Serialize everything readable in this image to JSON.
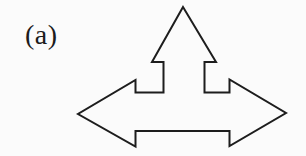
{
  "figure": {
    "label": "(a)",
    "background": "#fbfbfb",
    "ink_color": "#1d1d1d",
    "shape": {
      "name": "three-way-arrow",
      "description": "hollow outline arrow pointing up, left and right",
      "fill": "none",
      "stroke": "#1d1d1d",
      "stroke_width": "2",
      "points": "183,7 216,62 204.5,62 204.5,92.5 229.5,92.5 229.5,79.5 286,113 229.5,146 229.5,131 135.5,131 135.5,146.5 78,114 135.5,80 135.5,92.5 163.5,92.5 163.5,62 152,62"
    }
  }
}
